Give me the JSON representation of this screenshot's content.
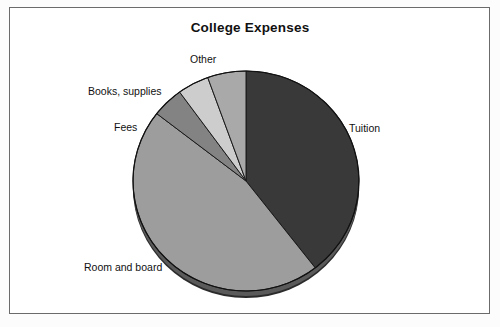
{
  "figure": {
    "title": "College Expenses",
    "frame_border_color": "#6b6b6b",
    "background_color": "#ffffff"
  },
  "labels": {
    "tuition": "Tuition",
    "other": "Other",
    "books_supplies": "Books, supplies",
    "fees": "Fees",
    "room_and_board": "Room and board"
  },
  "chart_data": {
    "type": "pie",
    "title": "College Expenses",
    "xlabel": "",
    "ylabel": "",
    "legend_position": "none",
    "labels_placement": "outside-callout",
    "categories": [
      "Tuition",
      "Room and board",
      "Fees",
      "Books, supplies",
      "Other"
    ],
    "values": [
      39.5,
      46.0,
      4.5,
      4.5,
      5.5
    ],
    "value_unit": "percent",
    "slices": [
      {
        "label": "Tuition",
        "value": 39.5,
        "color": "#393939",
        "start_angle_deg": 90.0,
        "end_angle_deg": -51.5
      },
      {
        "label": "Room and board",
        "value": 46.0,
        "color": "#9d9d9d",
        "start_angle_deg": -51.5,
        "end_angle_deg": -165.5
      },
      {
        "label": "Fees",
        "value": 4.5,
        "color": "#838383",
        "start_angle_deg": 194.5,
        "end_angle_deg": 145.5
      },
      {
        "label": "Books, supplies",
        "value": 4.5,
        "color": "#cdcdcd",
        "start_angle_deg": 145.5,
        "end_angle_deg": 130.0
      },
      {
        "label": "Other",
        "value": 5.5,
        "color": "#a9a9a9",
        "start_angle_deg": 130.0,
        "end_angle_deg": 90.0
      }
    ],
    "colors": [
      "#393939",
      "#9d9d9d",
      "#838383",
      "#cdcdcd",
      "#a9a9a9"
    ],
    "style": "3d-extruded-grayscale",
    "grid": false
  }
}
